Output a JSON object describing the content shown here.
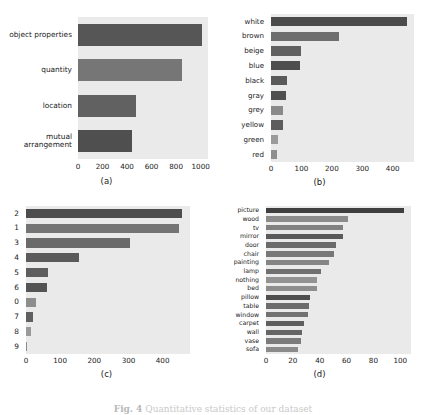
{
  "figure": {
    "caption_label": "Fig. 4",
    "caption_text": "Quantitative statistics of our dataset",
    "background": "#ffffff",
    "plot_background": "#eaeaea"
  },
  "panels": [
    {
      "id": "a",
      "caption": "(a)",
      "chart_data": {
        "type": "bar",
        "orientation": "horizontal",
        "title": "",
        "xlabel": "",
        "ylabel": "",
        "categories": [
          "object properties",
          "quantity",
          "location",
          "mutual\narrangement"
        ],
        "values": [
          1010,
          850,
          470,
          440
        ],
        "colors": [
          "#565656",
          "#767676",
          "#616161",
          "#4f4f4f"
        ],
        "xlim": [
          0,
          1060
        ],
        "xticks": [
          0,
          200,
          400,
          600,
          800,
          1000
        ],
        "xticklabels": [
          "0",
          "200",
          "400",
          "600",
          "800",
          "1000"
        ],
        "grid": false,
        "legend": "none"
      }
    },
    {
      "id": "b",
      "caption": "(b)",
      "chart_data": {
        "type": "bar",
        "orientation": "horizontal",
        "title": "",
        "xlabel": "",
        "ylabel": "",
        "categories": [
          "white",
          "brown",
          "beige",
          "blue",
          "black",
          "gray",
          "grey",
          "yellow",
          "green",
          "red"
        ],
        "values": [
          447,
          222,
          98,
          96,
          52,
          50,
          38,
          38,
          22,
          21
        ],
        "colors": [
          "#4b4b4b",
          "#6e6e6e",
          "#616161",
          "#4e4e4e",
          "#5a5a5a",
          "#505050",
          "#8a8a8a",
          "#5d5d5d",
          "#9b9b9b",
          "#8f8f8f"
        ],
        "xlim": [
          0,
          470
        ],
        "xticks": [
          0,
          100,
          200,
          300,
          400
        ],
        "xticklabels": [
          "0",
          "100",
          "200",
          "300",
          "400"
        ],
        "grid": false,
        "legend": "none"
      }
    },
    {
      "id": "c",
      "caption": "(c)",
      "chart_data": {
        "type": "bar",
        "orientation": "horizontal",
        "title": "",
        "xlabel": "",
        "ylabel": "",
        "categories": [
          "2",
          "1",
          "3",
          "4",
          "5",
          "6",
          "0",
          "7",
          "8",
          "9"
        ],
        "values": [
          458,
          448,
          303,
          155,
          63,
          62,
          29,
          21,
          15,
          4
        ],
        "colors": [
          "#4d4d4d",
          "#747474",
          "#6a6a6a",
          "#5b5b5b",
          "#5e5e5e",
          "#545454",
          "#8d8d8d",
          "#606060",
          "#9a9a9a",
          "#8a8a8a"
        ],
        "xlim": [
          0,
          480
        ],
        "xticks": [
          0,
          100,
          200,
          300,
          400
        ],
        "xticklabels": [
          "0",
          "100",
          "200",
          "300",
          "400"
        ],
        "grid": false,
        "legend": "none"
      }
    },
    {
      "id": "d",
      "caption": "(d)",
      "chart_data": {
        "type": "bar",
        "orientation": "horizontal",
        "title": "",
        "xlabel": "",
        "ylabel": "",
        "categories": [
          "picture",
          "wood",
          "tv",
          "mirror",
          "door",
          "chair",
          "painting",
          "lamp",
          "nothing",
          "bed",
          "pillow",
          "table",
          "window",
          "carpet",
          "wall",
          "vase",
          "sofa"
        ],
        "values": [
          103,
          61,
          57,
          57,
          52,
          51,
          47,
          41,
          38,
          38,
          33,
          32,
          31,
          28,
          27,
          26,
          24
        ],
        "colors": [
          "#3f3f3f",
          "#8b8b8b",
          "#818181",
          "#5a5a5a",
          "#6b6b6b",
          "#787878",
          "#858585",
          "#707070",
          "#939393",
          "#8e8e8e",
          "#4e4e4e",
          "#6c6c6c",
          "#727272",
          "#5f5f5f",
          "#656565",
          "#7b7b7b",
          "#8a8a8a"
        ],
        "xlim": [
          0,
          108
        ],
        "xticks": [
          0,
          20,
          40,
          60,
          80,
          100
        ],
        "xticklabels": [
          "0",
          "20",
          "40",
          "60",
          "80",
          "100"
        ],
        "grid": false,
        "legend": "none"
      }
    }
  ]
}
